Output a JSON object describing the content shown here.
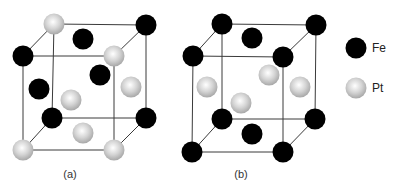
{
  "figure": {
    "panels": [
      {
        "label": "(a)",
        "description": "L1_0 ordered FePt unit cell (face-centered tetragonal, alternating Fe/Pt layers)"
      },
      {
        "label": "(b)",
        "description": "L1_2 ordered Fe3Pt-type unit cell (Fe at corners and top/bottom face centers, Pt at side face centers)"
      }
    ]
  },
  "legend": {
    "items": [
      {
        "element": "Fe",
        "color": "#000000"
      },
      {
        "element": "Pt",
        "color": "#c8c8c8"
      }
    ]
  }
}
